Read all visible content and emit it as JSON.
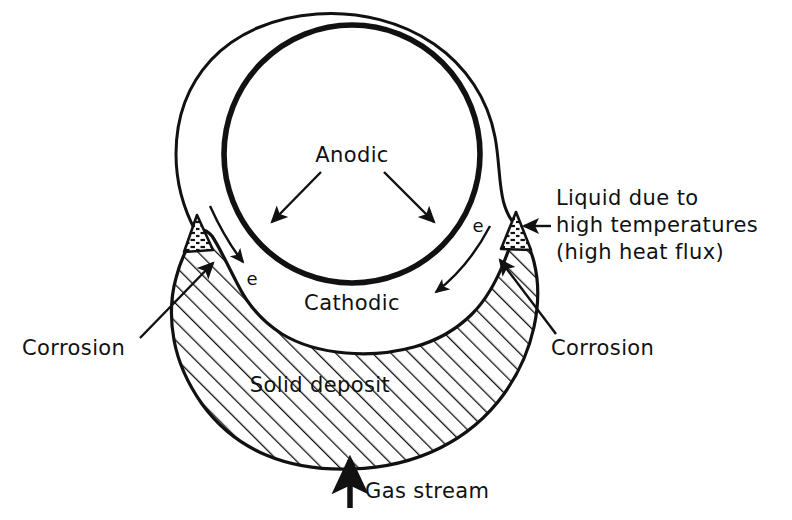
{
  "figure": {
    "background_color": "#ffffff",
    "ink_color": "#111111"
  },
  "labels": {
    "anodic": "Anodic",
    "cathodic": "Cathodic",
    "solid_deposit": "Solid deposit",
    "gas_stream": "Gas stream",
    "corrosion_left": "Corrosion",
    "corrosion_right": "Corrosion",
    "electron_left": "e",
    "electron_right": "e",
    "liquid_line1": "Liquid due to",
    "liquid_line2": "high temperatures",
    "liquid_line3": "(high heat flux)"
  },
  "elements": {
    "tube_outer": "outer tube wall",
    "tube_inner": "inner tube bore",
    "deposit": "hatched solid deposit",
    "liquid_tip_left": "stippled liquid cone left",
    "liquid_tip_right": "stippled liquid cone right"
  }
}
